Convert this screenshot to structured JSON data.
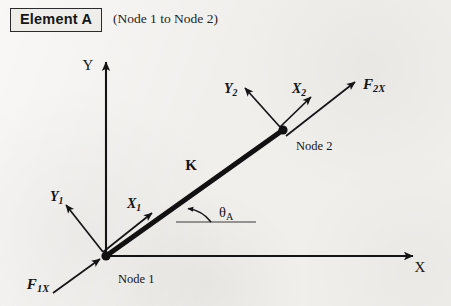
{
  "figure": {
    "title": "Element A",
    "note": "(Node 1 to Node 2)",
    "global_axes": {
      "x_label": "X",
      "y_label": "Y"
    },
    "element": {
      "stiffness_label": "K",
      "angle_label": "θ",
      "angle_subscript": "A"
    },
    "nodes": [
      {
        "name": "Node 1",
        "local_x": "X",
        "local_x_sub": "1",
        "local_y": "Y",
        "local_y_sub": "1",
        "force": "F",
        "force_sub": "1X"
      },
      {
        "name": "Node 2",
        "local_x": "X",
        "local_x_sub": "2",
        "local_y": "Y",
        "local_y_sub": "2",
        "force": "F",
        "force_sub": "2X"
      }
    ],
    "colors": {
      "ink": "#141414",
      "element": "#111111",
      "paper": "#f1efec"
    }
  }
}
